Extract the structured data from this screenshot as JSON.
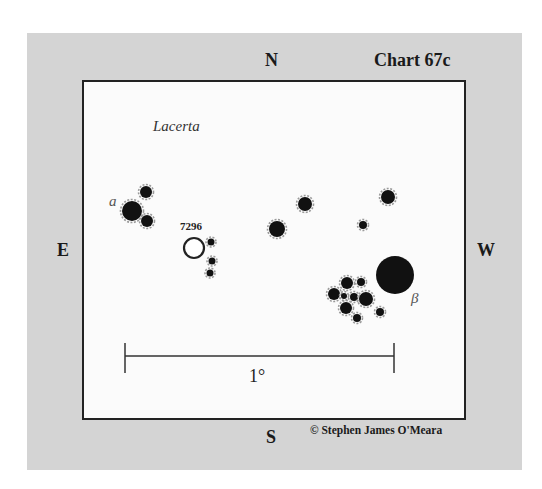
{
  "chart": {
    "title": "Chart 67c",
    "constellation": "Lacerta",
    "copyright": "© Stephen James O'Meara",
    "directions": {
      "north": "N",
      "south": "S",
      "east": "E",
      "west": "W"
    },
    "scale_label": "1°",
    "object_label": "7296",
    "star_labels": {
      "alpha": "a",
      "beta": "β"
    },
    "colors": {
      "panel": "#d4d4d4",
      "field": "#fbfbfb",
      "star": "#111111",
      "halo": "#9a9a9a",
      "border": "#222222"
    }
  },
  "stars": [
    {
      "x": 132,
      "y": 211,
      "r": 10,
      "name": "alpha"
    },
    {
      "x": 146,
      "y": 192,
      "r": 6
    },
    {
      "x": 147,
      "y": 221,
      "r": 6
    },
    {
      "x": 211,
      "y": 242,
      "r": 3.5
    },
    {
      "x": 212,
      "y": 261,
      "r": 3.5
    },
    {
      "x": 210,
      "y": 273,
      "r": 3.5
    },
    {
      "x": 277,
      "y": 229,
      "r": 8
    },
    {
      "x": 305,
      "y": 204,
      "r": 7
    },
    {
      "x": 388,
      "y": 197,
      "r": 7
    },
    {
      "x": 363,
      "y": 225,
      "r": 4
    },
    {
      "x": 395,
      "y": 275,
      "r": 19,
      "name": "beta"
    },
    {
      "x": 347,
      "y": 283,
      "r": 6
    },
    {
      "x": 361,
      "y": 282,
      "r": 4
    },
    {
      "x": 334,
      "y": 294,
      "r": 6
    },
    {
      "x": 344,
      "y": 296,
      "r": 3
    },
    {
      "x": 354,
      "y": 297,
      "r": 4
    },
    {
      "x": 366,
      "y": 299,
      "r": 7
    },
    {
      "x": 346,
      "y": 308,
      "r": 6
    },
    {
      "x": 357,
      "y": 318,
      "r": 4
    },
    {
      "x": 380,
      "y": 312,
      "r": 4
    }
  ],
  "open_cluster": {
    "x": 194,
    "y": 248,
    "r": 10
  },
  "scale_bar": {
    "x1": 125,
    "x2": 394,
    "y": 356,
    "tick_top": 343,
    "tick_bottom": 373
  }
}
